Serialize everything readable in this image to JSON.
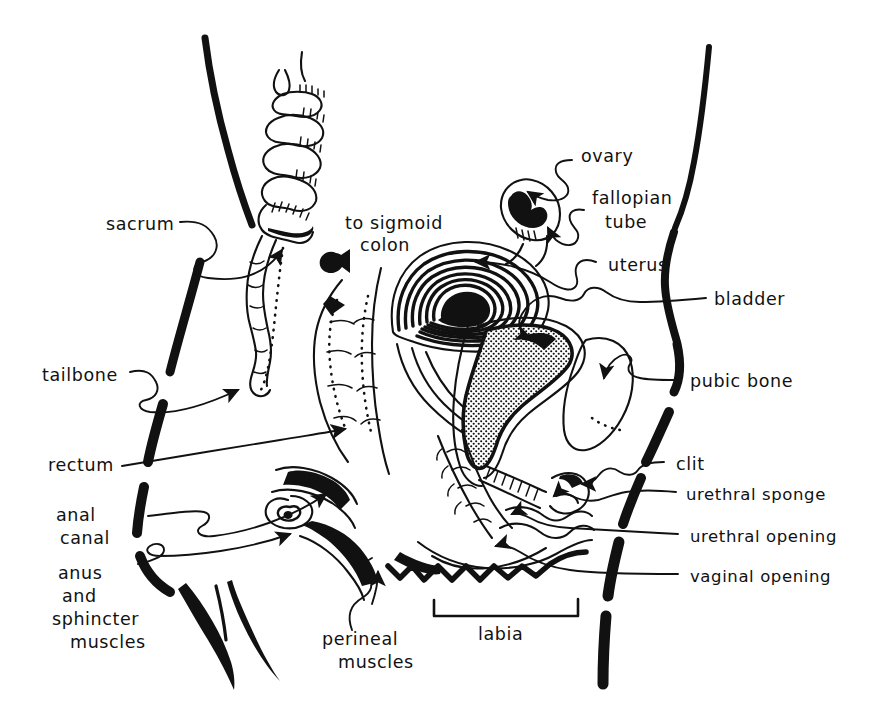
{
  "figure": {
    "kind": "hand-drawn-anatomical-diagram",
    "style": "black ink line drawing on white",
    "width": 887,
    "height": 714,
    "ink_color": "#111111",
    "background_color": "#ffffff"
  },
  "labels": {
    "sacrum": "sacrum",
    "tailbone": "tailbone",
    "rectum": "rectum",
    "anal_canal_line1": "anal",
    "anal_canal_line2": "canal",
    "anus_line1": "anus",
    "anus_line2": "and",
    "anus_line3": "sphincter",
    "anus_line4": "muscles",
    "sigmoid_line1": "to sigmoid",
    "sigmoid_line2": "colon",
    "ovary": "ovary",
    "fallopian_line1": "fallopian",
    "fallopian_line2": "tube",
    "uterus": "uterus",
    "bladder": "bladder",
    "pubic_bone": "pubic bone",
    "clit": "clit",
    "urethral_sponge": "urethral sponge",
    "urethral_opening": "urethral opening",
    "vaginal_opening": "vaginal opening",
    "perineal_line1": "perineal",
    "perineal_line2": "muscles",
    "labia": "labia"
  },
  "structures": [
    "body outline (left buttock/thigh)",
    "body outline (right abdomen/thigh)",
    "sacrum vertebrae",
    "coccyx / tailbone",
    "rectum",
    "anal canal",
    "anus and sphincter muscles",
    "sigmoid colon stub",
    "ovary",
    "fallopian tube",
    "uterus (layered muscle wall)",
    "bladder (stippled)",
    "pubic bone",
    "urethra",
    "urethral sponge",
    "clitoris",
    "vaginal canal",
    "perineal muscles",
    "labia"
  ]
}
